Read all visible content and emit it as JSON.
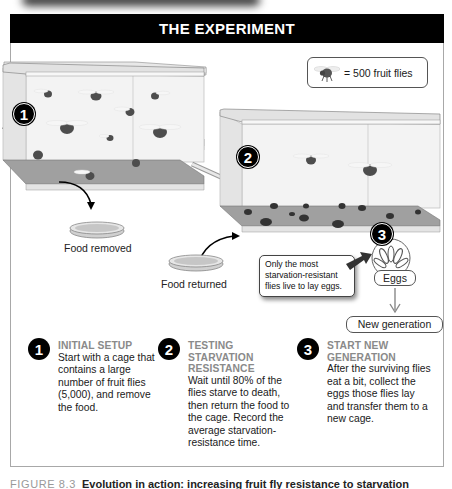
{
  "header": {
    "title": "THE EXPERIMENT"
  },
  "legend": {
    "icon": "fruit-fly-icon",
    "text": "= 500 fruit flies"
  },
  "diagram": {
    "cage1": {
      "badge": "1",
      "fly_count_shown": 10
    },
    "cage2": {
      "badge": "2",
      "flying_flies": 2,
      "dead_flies": 11
    },
    "eggs": {
      "badge": "3",
      "label": "Eggs"
    },
    "labels": {
      "food_removed": "Food removed",
      "food_returned": "Food returned"
    },
    "callout": "Only the most starvation-resistant flies live to lay eggs.",
    "new_generation": "New generation"
  },
  "steps": [
    {
      "number": "1",
      "title": "INITIAL SETUP",
      "description": "Start with a cage that contains a large number of fruit flies (5,000), and remove the food."
    },
    {
      "number": "2",
      "title": "TESTING STARVATION RESISTANCE",
      "description": "Wait until 80% of the flies starve to death, then return the food to the cage. Record the average starvation-resistance time."
    },
    {
      "number": "3",
      "title": "START NEW GENERATION",
      "description": "After the surviving flies eat a bit, collect the eggs those flies lay and transfer them to a new cage."
    }
  ],
  "caption": {
    "figure": "FIGURE 8.3",
    "title": "Evolution in action: increasing fruit fly resistance to starvation"
  },
  "colors": {
    "header_bg": "#000000",
    "header_text": "#ffffff",
    "step_title": "#8a8a8a",
    "cage_floor": "#9a9a9a",
    "glass": "#ececec"
  }
}
